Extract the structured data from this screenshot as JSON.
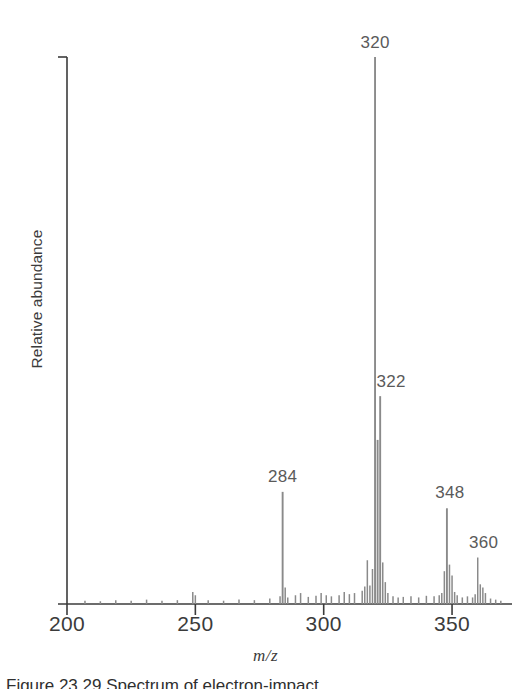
{
  "figure": {
    "caption": "Figure 23.29   Spectrum of electron-impact",
    "y_axis_title": "Relative abundance",
    "x_axis_title": "m/z"
  },
  "axes": {
    "x_ticks": [
      {
        "value": 200,
        "label": "200"
      },
      {
        "value": 250,
        "label": "250"
      },
      {
        "value": 300,
        "label": "300"
      },
      {
        "value": 350,
        "label": "350"
      }
    ],
    "x_min": 200,
    "x_max": 370,
    "y_min": 0,
    "y_max": 100
  },
  "annotations": [
    {
      "id": "peak-320",
      "label": "320",
      "mz": 320,
      "y_pct": 100
    },
    {
      "id": "peak-322",
      "label": "322",
      "mz": 322,
      "y_pct": 38
    },
    {
      "id": "peak-284",
      "label": "284",
      "mz": 284,
      "y_pct": 20.5
    },
    {
      "id": "peak-348",
      "label": "348",
      "mz": 348,
      "y_pct": 17.5
    },
    {
      "id": "peak-360",
      "label": "360",
      "mz": 360,
      "y_pct": 8.5
    }
  ],
  "chart_data": {
    "type": "bar",
    "title": "",
    "subtitle": "",
    "xlabel": "m/z",
    "ylabel": "Relative abundance",
    "xlim": [
      200,
      370
    ],
    "ylim": [
      0,
      100
    ],
    "grid": false,
    "legend": "none",
    "xtick_labels": [
      "200",
      "250",
      "300",
      "350"
    ],
    "xtick_values": [
      200,
      250,
      300,
      350
    ],
    "ytick_labels": [],
    "series_name": "Relative abundance",
    "bar_color": "#8a8a8a",
    "axis_color": "#3b3b3b",
    "x": [
      207,
      213,
      219,
      225,
      231,
      237,
      243,
      249,
      250,
      255,
      261,
      267,
      273,
      279,
      283,
      284,
      285,
      286,
      289,
      291,
      294,
      297,
      299,
      301,
      303,
      306,
      308,
      310,
      312,
      315,
      316,
      317,
      318,
      319,
      320,
      321,
      322,
      323,
      324,
      325,
      327,
      329,
      331,
      334,
      337,
      340,
      343,
      345,
      346,
      347,
      348,
      349,
      350,
      351,
      352,
      354,
      356,
      358,
      359,
      360,
      361,
      362,
      363,
      365,
      367,
      369
    ],
    "values": [
      0.6,
      0.5,
      0.7,
      0.6,
      0.8,
      0.6,
      0.7,
      2.2,
      1.6,
      0.7,
      0.6,
      0.8,
      0.7,
      1.0,
      1.4,
      20.5,
      3.0,
      1.2,
      1.6,
      2.0,
      1.3,
      1.5,
      2.0,
      1.6,
      1.4,
      1.6,
      2.2,
      1.8,
      2.0,
      2.4,
      3.2,
      8.0,
      3.4,
      6.4,
      100.0,
      30.0,
      38.0,
      7.6,
      4.0,
      2.0,
      1.4,
      1.2,
      1.3,
      1.4,
      1.2,
      1.5,
      1.4,
      1.6,
      2.0,
      6.0,
      17.5,
      7.2,
      5.2,
      2.2,
      1.6,
      1.2,
      1.4,
      1.2,
      1.8,
      8.5,
      3.6,
      3.0,
      2.0,
      1.0,
      0.8,
      0.6
    ]
  }
}
